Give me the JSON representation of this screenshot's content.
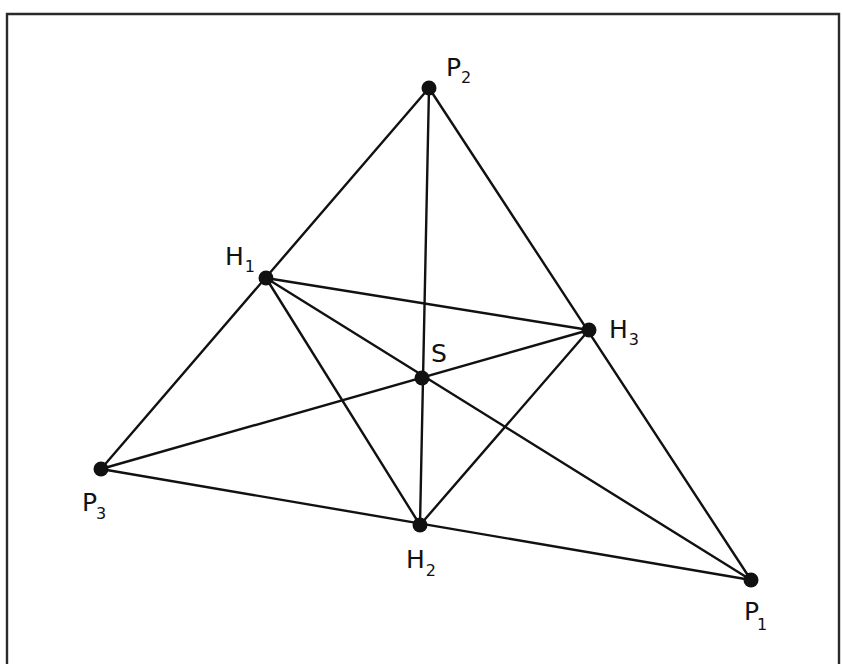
{
  "figure": {
    "colors": {
      "ink": "#111111",
      "frame": "#2a2a2a",
      "background": "#ffffff"
    }
  },
  "points": {
    "P1": {
      "name": "P",
      "sub": "1",
      "x": 751,
      "y": 580
    },
    "P2": {
      "name": "P",
      "sub": "2",
      "x": 429,
      "y": 88
    },
    "P3": {
      "name": "P",
      "sub": "3",
      "x": 101,
      "y": 469
    },
    "H1": {
      "name": "H",
      "sub": "1",
      "x": 266,
      "y": 278
    },
    "H2": {
      "name": "H",
      "sub": "2",
      "x": 420,
      "y": 525
    },
    "H3": {
      "name": "H",
      "sub": "3",
      "x": 589,
      "y": 330
    },
    "S": {
      "name": "S",
      "sub": "",
      "x": 422,
      "y": 378
    }
  },
  "segments": [
    [
      "P1",
      "P2"
    ],
    [
      "P2",
      "P3"
    ],
    [
      "P3",
      "P1"
    ],
    [
      "H1",
      "H2"
    ],
    [
      "H2",
      "H3"
    ],
    [
      "H3",
      "H1"
    ],
    [
      "P1",
      "H1"
    ],
    [
      "P2",
      "H2"
    ],
    [
      "P3",
      "H3"
    ]
  ],
  "labels": {
    "P1": {
      "main": "P",
      "sub": "1"
    },
    "P2": {
      "main": "P",
      "sub": "2"
    },
    "P3": {
      "main": "P",
      "sub": "3"
    },
    "H1": {
      "main": "H",
      "sub": "1"
    },
    "H2": {
      "main": "H",
      "sub": "2"
    },
    "H3": {
      "main": "H",
      "sub": "3"
    },
    "S": {
      "main": "S"
    }
  }
}
